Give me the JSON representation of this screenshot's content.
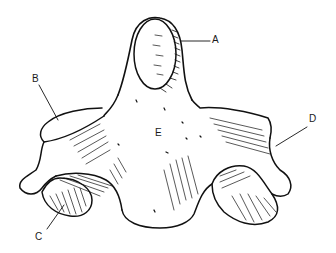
{
  "figure": {
    "labels": {
      "A": "A",
      "B": "B",
      "C": "C",
      "D": "D",
      "E": "E"
    }
  }
}
